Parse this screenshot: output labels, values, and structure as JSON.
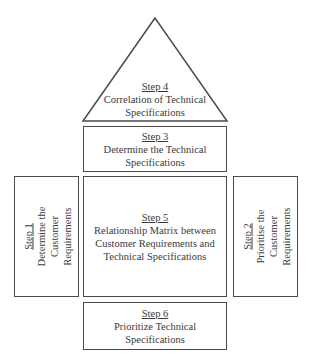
{
  "diagram": {
    "type": "house-of-quality",
    "steps": {
      "step4": {
        "label": "Step 4",
        "description": "Correlation of Technical\nSpecifications",
        "shape": "triangle"
      },
      "step3": {
        "label": "Step 3",
        "description": "Determine the Technical\nSpecifications"
      },
      "step1": {
        "label": "Step 1",
        "description": "Determine the\nCustomer\nRequirements"
      },
      "step5": {
        "label": "Step 5",
        "description": "Relationship Matrix between\nCustomer Requirements and\nTechnical Specifications"
      },
      "step2": {
        "label": "Step 2",
        "description": "Prioritise the\nCustomer\nRequirements"
      },
      "step6": {
        "label": "Step 6",
        "description": "Prioritize Technical\nSpecifications"
      }
    },
    "colors": {
      "stroke": "#4a4a4a",
      "text": "#3a3a3a",
      "background": "#ffffff"
    }
  }
}
